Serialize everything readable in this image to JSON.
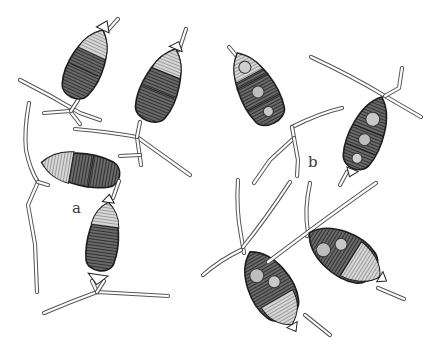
{
  "figure": {
    "type": "scientific-illustration",
    "labels": [
      {
        "id": "a",
        "text": "a",
        "x": 75,
        "y": 213
      },
      {
        "id": "b",
        "text": "b",
        "x": 312,
        "y": 167
      }
    ],
    "colors": {
      "background": "#ffffff",
      "ink": "#1e1e1e",
      "hatch_dark": "#3c3c3c",
      "hatch_light": "#8a8a8a",
      "appendage": "#555555"
    },
    "spores": [
      {
        "group": "a",
        "name": "spore-a1",
        "cx": 85,
        "cy": 78,
        "rx": 19,
        "ry": 40,
        "rotate": 25
      },
      {
        "group": "a",
        "name": "spore-a2",
        "cx": 160,
        "cy": 90,
        "rx": 20,
        "ry": 42,
        "rotate": 22
      },
      {
        "group": "a",
        "name": "spore-a3",
        "cx": 85,
        "cy": 170,
        "rx": 16,
        "ry": 44,
        "rotate": -80
      },
      {
        "group": "a",
        "name": "spore-a4",
        "cx": 103,
        "cy": 242,
        "rx": 16,
        "ry": 40,
        "rotate": 8
      },
      {
        "group": "b",
        "name": "spore-b1",
        "cx": 258,
        "cy": 92,
        "rx": 20,
        "ry": 44,
        "rotate": -28
      },
      {
        "group": "b",
        "name": "spore-b2",
        "cx": 366,
        "cy": 136,
        "rx": 19,
        "ry": 42,
        "rotate": 22
      },
      {
        "group": "b",
        "name": "spore-b3",
        "cx": 269,
        "cy": 288,
        "rx": 24,
        "ry": 44,
        "rotate": -30
      },
      {
        "group": "b",
        "name": "spore-b4",
        "cx": 342,
        "cy": 256,
        "rx": 24,
        "ry": 42,
        "rotate": -58
      }
    ]
  }
}
